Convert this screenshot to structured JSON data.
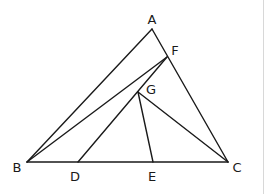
{
  "diagram": {
    "points": {
      "A": {
        "x": 152,
        "y": 29,
        "label": "A",
        "lx": 152,
        "ly": 24,
        "anchor": "middle"
      },
      "B": {
        "x": 27,
        "y": 162,
        "label": "B",
        "lx": 17,
        "ly": 172,
        "anchor": "middle"
      },
      "C": {
        "x": 228,
        "y": 162,
        "label": "C",
        "lx": 237,
        "ly": 172,
        "anchor": "middle"
      },
      "D": {
        "x": 78,
        "y": 162,
        "label": "D",
        "lx": 75,
        "ly": 181,
        "anchor": "middle"
      },
      "E": {
        "x": 153,
        "y": 162,
        "label": "E",
        "lx": 152,
        "ly": 181,
        "anchor": "middle"
      },
      "F": {
        "x": 167,
        "y": 57,
        "label": "F",
        "lx": 175,
        "ly": 55,
        "anchor": "middle"
      },
      "G": {
        "x": 138,
        "y": 92,
        "label": "G",
        "lx": 151,
        "ly": 94,
        "anchor": "middle"
      }
    },
    "segments": [
      {
        "id": "AB",
        "from": "A",
        "to": "B"
      },
      {
        "id": "AC",
        "from": "A",
        "to": "C"
      },
      {
        "id": "BC",
        "from": "B",
        "to": "C"
      },
      {
        "id": "BF",
        "from": "B",
        "to": "F"
      },
      {
        "id": "DF",
        "from": "D",
        "to": "F"
      },
      {
        "id": "GE",
        "from": "G",
        "to": "E"
      },
      {
        "id": "GC",
        "from": "G",
        "to": "C"
      }
    ],
    "line_color": "#1a1a1a",
    "label_color": "#1a1a1a"
  }
}
